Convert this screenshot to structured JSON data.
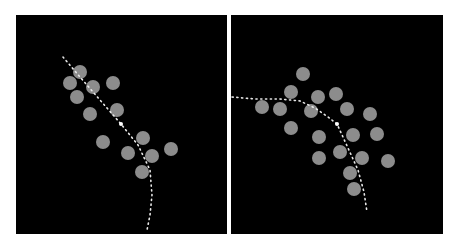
{
  "figure": {
    "background": "#ffffff",
    "panel_color": "#000000",
    "circle_color": "#8c8c8c",
    "path_color": "#e8e8e8",
    "circle_radius": 7
  },
  "panels": [
    {
      "id": "left",
      "label": "",
      "circles": [
        [
          80,
          72
        ],
        [
          70,
          83
        ],
        [
          93,
          87
        ],
        [
          113,
          83
        ],
        [
          77,
          97
        ],
        [
          90,
          114
        ],
        [
          117,
          110
        ],
        [
          103,
          142
        ],
        [
          143,
          138
        ],
        [
          128,
          153
        ],
        [
          152,
          156
        ],
        [
          171,
          149
        ],
        [
          142,
          172
        ]
      ],
      "path": [
        [
          63,
          57
        ],
        [
          80,
          77
        ],
        [
          100,
          100
        ],
        [
          121,
          124
        ],
        [
          138,
          145
        ],
        [
          150,
          170
        ],
        [
          152,
          195
        ],
        [
          150,
          215
        ],
        [
          147,
          230
        ]
      ],
      "marker": [
        121,
        124
      ]
    },
    {
      "id": "right",
      "label": "",
      "circles": [
        [
          303,
          74
        ],
        [
          291,
          92
        ],
        [
          318,
          97
        ],
        [
          336,
          94
        ],
        [
          262,
          107
        ],
        [
          280,
          109
        ],
        [
          311,
          111
        ],
        [
          347,
          109
        ],
        [
          370,
          114
        ],
        [
          291,
          128
        ],
        [
          319,
          137
        ],
        [
          353,
          135
        ],
        [
          377,
          134
        ],
        [
          319,
          158
        ],
        [
          340,
          152
        ],
        [
          362,
          158
        ],
        [
          388,
          161
        ],
        [
          350,
          173
        ],
        [
          354,
          189
        ]
      ],
      "path": [
        [
          232,
          97
        ],
        [
          255,
          99
        ],
        [
          280,
          99
        ],
        [
          300,
          101
        ],
        [
          315,
          108
        ],
        [
          328,
          117
        ],
        [
          337,
          124
        ],
        [
          348,
          148
        ],
        [
          358,
          170
        ],
        [
          364,
          192
        ],
        [
          367,
          212
        ]
      ],
      "marker": [
        337,
        124
      ]
    }
  ]
}
